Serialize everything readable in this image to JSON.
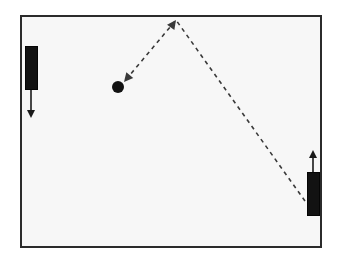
{
  "scene": {
    "title": "Pong game state diagram",
    "width": 339,
    "height": 267,
    "background_color": "#ffffff"
  },
  "court": {
    "label": "playfield",
    "x": 20,
    "y": 15,
    "width": 302,
    "height": 233,
    "border_color": "#2b2b2b",
    "border_width": 2,
    "fill_color": "#f7f7f7"
  },
  "paddles": [
    {
      "id": "left-paddle",
      "label": "Left paddle",
      "x": 25,
      "y": 46,
      "width": 13,
      "height": 44,
      "color": "#121212",
      "motion": {
        "direction": "down",
        "arrow_from_y": 90,
        "arrow_to_y": 118,
        "arrow_x": 31,
        "color": "#1a1a1a"
      }
    },
    {
      "id": "right-paddle",
      "label": "Right paddle",
      "x": 307,
      "y": 172,
      "width": 13,
      "height": 44,
      "color": "#121212",
      "motion": {
        "direction": "up",
        "arrow_from_y": 172,
        "arrow_to_y": 150,
        "arrow_x": 313,
        "color": "#1a1a1a"
      }
    }
  ],
  "ball": {
    "id": "ball",
    "label": "Ball",
    "cx": 118,
    "cy": 87,
    "radius": 6,
    "color": "#121212"
  },
  "trajectory": {
    "label": "Ball trajectory",
    "style": "dashed",
    "dash_pattern": "4 4",
    "stroke_color": "#3a3a3a",
    "stroke_width": 1.6,
    "direction": "from right paddle, bounce off top wall, toward ball",
    "points": [
      {
        "name": "right-paddle-contact",
        "x": 305,
        "y": 201
      },
      {
        "name": "top-wall-bounce",
        "x": 176,
        "y": 20
      },
      {
        "name": "ball-position",
        "x": 124,
        "y": 82
      }
    ],
    "arrowheads": [
      {
        "name": "bounce-arrowhead",
        "x": 176,
        "y": 20,
        "angle_deg": -54
      },
      {
        "name": "ball-arrowhead",
        "x": 124,
        "y": 82,
        "angle_deg": 130
      }
    ]
  }
}
